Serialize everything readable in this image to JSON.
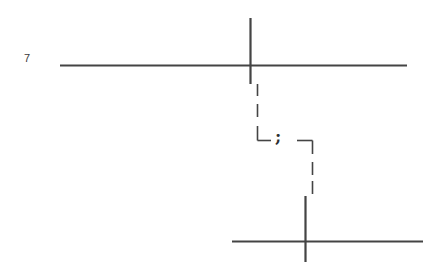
{
  "diagram": {
    "labels": {
      "row_number": "7",
      "center_symbol": ";"
    },
    "colors": {
      "line": "#444444",
      "background": "#ffffff"
    },
    "top_cross": {
      "horizontal": {
        "x1": 60,
        "y1": 65,
        "x2": 407,
        "y2": 65
      },
      "vertical": {
        "x1": 250,
        "y1": 18,
        "x2": 250,
        "y2": 84
      }
    },
    "bottom_cross": {
      "horizontal": {
        "x1": 232,
        "y1": 241,
        "x2": 423,
        "y2": 241
      },
      "vertical": {
        "x1": 305,
        "y1": 196,
        "x2": 305,
        "y2": 262
      }
    },
    "connector": {
      "style": "dashed",
      "path": "M257,84 L257,140 L275,140 M297,140 L312,140 L312,194"
    }
  }
}
